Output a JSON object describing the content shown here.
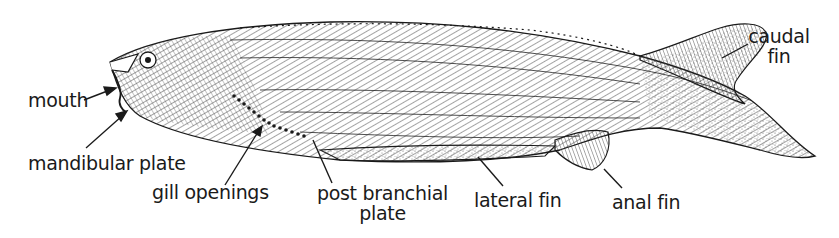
{
  "figure": {
    "colors": {
      "ink": "#1a1a1a",
      "background": "#ffffff"
    }
  },
  "labels": {
    "mouth": "mouth",
    "mandibular_plate": "mandibular plate",
    "gill_openings": "gill openings",
    "post_branchial_line1": "post branchial",
    "post_branchial_line2": "plate",
    "lateral_fin": "lateral fin",
    "anal_fin": "anal fin",
    "caudal_line1": "caudal",
    "caudal_line2": "fin"
  }
}
